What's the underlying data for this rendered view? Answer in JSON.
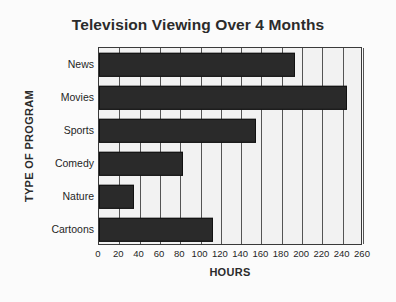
{
  "chart_data": {
    "type": "bar",
    "orientation": "horizontal",
    "title": "Television Viewing Over 4 Months",
    "xlabel": "HOURS",
    "ylabel": "TYPE OF PROGRAM",
    "categories": [
      "News",
      "Movies",
      "Sports",
      "Comedy",
      "Nature",
      "Cartoons"
    ],
    "values": [
      193,
      244,
      155,
      83,
      34,
      112
    ],
    "xlim": [
      0,
      260
    ],
    "xticks": [
      0,
      20,
      40,
      60,
      80,
      100,
      120,
      140,
      160,
      180,
      200,
      220,
      240,
      260
    ],
    "xtick_labels": [
      "0",
      "20",
      "40",
      "60",
      "80",
      "100",
      "120",
      "140",
      "160",
      "180",
      "200",
      "220",
      "240",
      "260"
    ],
    "grid": "vertical",
    "legend": "none",
    "colors": {
      "bar": "#2a2a2a",
      "bar_edge": "#111111",
      "plot_background": "#f2f2f2",
      "figure_background": "#fbfbfb",
      "gridline": "#555555",
      "axis_frame": "#3a3a3a",
      "text": "#1f1f1f",
      "title_text": "#2b2b2b"
    }
  }
}
